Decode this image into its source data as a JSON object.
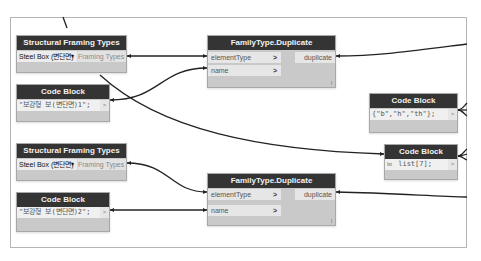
{
  "canvas": {
    "background": "#ffffff",
    "frame_border": "#b5b5b5",
    "wire_color": "#222222",
    "node_header_color": "#343434",
    "node_body_color": "#c9c9c9"
  },
  "nodes": [
    {
      "id": "sft1",
      "title": "Structural Framing Types",
      "dropdown_value": "Steel Box (변단면)",
      "dropdown_arrow": "▾",
      "output_label": "Framing Types"
    },
    {
      "id": "cb1",
      "title": "Code Block",
      "code": "\"보강형 보(변단면)1\";",
      "output_port": ">"
    },
    {
      "id": "ftd1",
      "title": "FamilyType.Duplicate",
      "inputs": [
        {
          "label": "elementType",
          "chevron": ">"
        },
        {
          "label": "name",
          "chevron": ">"
        }
      ],
      "output": "duplicate",
      "lacing": "l"
    },
    {
      "id": "cb_bht",
      "title": "Code Block",
      "code": "{\"b\",\"h\",\"th\"};",
      "output_port": ">"
    },
    {
      "id": "sft2",
      "title": "Structural Framing Types",
      "dropdown_value": "Steel Box (변단면)",
      "dropdown_arrow": "▾",
      "output_label": "Framing Types"
    },
    {
      "id": "cb_list",
      "title": "Code Block",
      "input_label": "lst",
      "code": "list[7];",
      "output_port": ">"
    },
    {
      "id": "cb2",
      "title": "Code Block",
      "code": "\"보강형 보(변단면)2\";",
      "output_port": ">"
    },
    {
      "id": "ftd2",
      "title": "FamilyType.Duplicate",
      "inputs": [
        {
          "label": "elementType",
          "chevron": ">"
        },
        {
          "label": "name",
          "chevron": ">"
        }
      ],
      "output": "duplicate",
      "lacing": "l"
    }
  ]
}
